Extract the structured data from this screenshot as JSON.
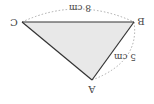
{
  "diagram": {
    "type": "triangle",
    "orientation": "rotated 180 degrees",
    "vertices": {
      "A": "A",
      "B": "B",
      "C": "C"
    },
    "sides": {
      "CB": "8 cm",
      "BA": "5 cm"
    },
    "colors": {
      "fill": "#e8e8e8",
      "edge": "#333333",
      "dotted": "#aaaaaa",
      "text": "#444444"
    }
  }
}
